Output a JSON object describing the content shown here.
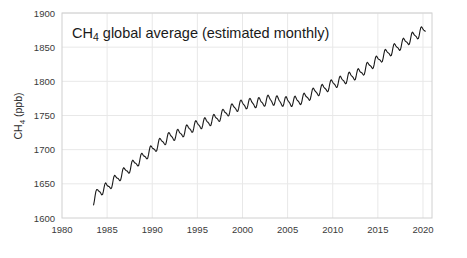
{
  "chart_data": {
    "type": "line",
    "title": "CH4 global average (estimated monthly)",
    "title_parts": {
      "prefix": "CH",
      "subscript": "4",
      "suffix": " global average (estimated monthly)"
    },
    "xlabel": "",
    "ylabel": "CH4 (ppb)",
    "ylabel_parts": {
      "prefix": "CH",
      "subscript": "4",
      "suffix": " (ppb)"
    },
    "xlim": [
      1980,
      2021
    ],
    "ylim": [
      1600,
      1900
    ],
    "xticks": [
      1980,
      1985,
      1990,
      1995,
      2000,
      2005,
      2010,
      2015,
      2020
    ],
    "yticks": [
      1600,
      1650,
      1700,
      1750,
      1800,
      1850,
      1900
    ],
    "xtick_labels": [
      "1980",
      "1985",
      "1990",
      "1995",
      "2000",
      "2005",
      "2010",
      "2015",
      "2020"
    ],
    "ytick_labels": [
      "1600",
      "1650",
      "1700",
      "1750",
      "1800",
      "1850",
      "1900"
    ],
    "grid": true,
    "legend": null,
    "line_color": "#1a1a1a",
    "grid_color": "#e8e8e8",
    "frame_color": "#d0d0d0",
    "background_color": "#ffffff",
    "series": [
      {
        "name": "CH4 global average",
        "x_start": 1983.5,
        "x_end": 2020.3,
        "sample_interval_years": 0.08333,
        "annual_trend": [
          {
            "year": 1983.5,
            "value": 1626
          },
          {
            "year": 1984.0,
            "value": 1638
          },
          {
            "year": 1985.0,
            "value": 1645
          },
          {
            "year": 1986.0,
            "value": 1657
          },
          {
            "year": 1987.0,
            "value": 1668
          },
          {
            "year": 1988.0,
            "value": 1679
          },
          {
            "year": 1989.0,
            "value": 1689
          },
          {
            "year": 1990.0,
            "value": 1700
          },
          {
            "year": 1991.0,
            "value": 1711
          },
          {
            "year": 1992.0,
            "value": 1719
          },
          {
            "year": 1993.0,
            "value": 1723
          },
          {
            "year": 1994.0,
            "value": 1730
          },
          {
            "year": 1995.0,
            "value": 1736
          },
          {
            "year": 1996.0,
            "value": 1740
          },
          {
            "year": 1997.0,
            "value": 1745
          },
          {
            "year": 1998.0,
            "value": 1753
          },
          {
            "year": 1999.0,
            "value": 1761
          },
          {
            "year": 2000.0,
            "value": 1766
          },
          {
            "year": 2001.0,
            "value": 1768
          },
          {
            "year": 2002.0,
            "value": 1769
          },
          {
            "year": 2003.0,
            "value": 1773
          },
          {
            "year": 2004.0,
            "value": 1771
          },
          {
            "year": 2005.0,
            "value": 1770
          },
          {
            "year": 2006.0,
            "value": 1771
          },
          {
            "year": 2007.0,
            "value": 1776
          },
          {
            "year": 2008.0,
            "value": 1784
          },
          {
            "year": 2009.0,
            "value": 1789
          },
          {
            "year": 2010.0,
            "value": 1796
          },
          {
            "year": 2011.0,
            "value": 1801
          },
          {
            "year": 2012.0,
            "value": 1807
          },
          {
            "year": 2013.0,
            "value": 1812
          },
          {
            "year": 2014.0,
            "value": 1822
          },
          {
            "year": 2015.0,
            "value": 1831
          },
          {
            "year": 2016.0,
            "value": 1841
          },
          {
            "year": 2017.0,
            "value": 1849
          },
          {
            "year": 2018.0,
            "value": 1857
          },
          {
            "year": 2019.0,
            "value": 1866
          },
          {
            "year": 2020.3,
            "value": 1876
          }
        ],
        "seasonal_amplitude_ppb": 13,
        "seasonal_peak_phase": 0.88,
        "description": "Monthly global mean atmospheric methane with seasonal cycle superimposed on rising trend"
      }
    ]
  },
  "plot_geometry": {
    "left": 62,
    "right": 432,
    "top": 13,
    "bottom": 218
  }
}
